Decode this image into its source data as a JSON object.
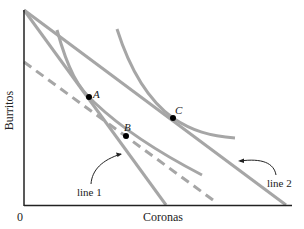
{
  "axes": {
    "x_label": "Coronas",
    "y_label": "Burritos",
    "origin_label": "0"
  },
  "lines": [
    {
      "name": "line 1",
      "label": "line 1"
    },
    {
      "name": "line 2",
      "label": "line 2"
    }
  ],
  "points": [
    {
      "name": "A",
      "label": "A"
    },
    {
      "name": "B",
      "label": "B"
    },
    {
      "name": "C",
      "label": "C"
    }
  ],
  "colors": {
    "axis": "#222222",
    "line": "#a6a6a6",
    "point": "#000000"
  }
}
